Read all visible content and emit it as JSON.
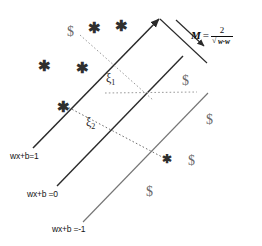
{
  "figure": {
    "background": "#ffffff",
    "line_color": "#2a2a2a",
    "dotted_color": "#8a8a8a",
    "star_color": "#2f2f2f",
    "dollar_color": "#6b6b6b"
  },
  "hyperplanes": [
    {
      "id": "upper",
      "label": "wx+b=1",
      "label_x": 10,
      "label_y": 152
    },
    {
      "id": "decision",
      "label": "wx+b =0",
      "label_x": 27,
      "label_y": 189
    },
    {
      "id": "lower",
      "label": "wx+b =-1",
      "label_x": 52,
      "label_y": 224
    }
  ],
  "slack_labels": [
    {
      "id": "xi1",
      "symbol": "ξ",
      "subscript": "1",
      "x": 108,
      "y": 78
    },
    {
      "id": "xi2",
      "symbol": "ξ",
      "subscript": "2",
      "x": 88,
      "y": 122
    }
  ],
  "margin": {
    "symbol": "M",
    "equals": "=",
    "numerator": "2",
    "denominator_radicand": "w∙w",
    "full_text": "M = 2 / sqrt(w∙w)",
    "x": 190,
    "y": 30
  },
  "markers": {
    "star_glyph": "✱",
    "dollar_glyph": "$",
    "stars": [
      {
        "x": 95,
        "y": 28,
        "note": "class-plus-above-margin"
      },
      {
        "x": 122,
        "y": 26,
        "note": "class-plus-above-margin"
      },
      {
        "x": 45,
        "y": 66,
        "note": "class-plus-left"
      },
      {
        "x": 83,
        "y": 68,
        "note": "class-plus-left"
      },
      {
        "x": 63,
        "y": 107,
        "note": "support-vector-on-upper-line"
      },
      {
        "x": 168,
        "y": 160,
        "note": "misclassified-plus-below-lower-line"
      }
    ],
    "dollars": [
      {
        "x": 72,
        "y": 31,
        "note": "misclassified-dollar-above-upper-line"
      },
      {
        "x": 186,
        "y": 80,
        "note": "support-vector-on-lower-line"
      },
      {
        "x": 210,
        "y": 119,
        "note": "class-minus-right"
      },
      {
        "x": 192,
        "y": 160,
        "note": "class-minus-right"
      },
      {
        "x": 150,
        "y": 191,
        "note": "class-minus-right"
      }
    ]
  },
  "geometry": {
    "upper_line": {
      "x1": 33,
      "y1": 148,
      "x2": 160,
      "y2": 18
    },
    "decision_line": {
      "x1": 57,
      "y1": 186,
      "x2": 183,
      "y2": 55
    },
    "lower_line": {
      "x1": 83,
      "y1": 222,
      "x2": 208,
      "y2": 92
    },
    "margin_top_edge": {
      "x1": 160,
      "y1": 18,
      "x2": 207,
      "y2": 62
    },
    "margin_arrow": {
      "x1": 177,
      "y1": 20,
      "x2": 205,
      "y2": 47
    },
    "slack_dotted_1": {
      "x1": 80,
      "y1": 34,
      "x2": 152,
      "y2": 99
    },
    "slack_dotted_2": {
      "x1": 63,
      "y1": 104,
      "x2": 163,
      "y2": 158
    },
    "margin_side_dotted": {
      "x1": 106,
      "y1": 93,
      "x2": 196,
      "y2": 93
    }
  }
}
